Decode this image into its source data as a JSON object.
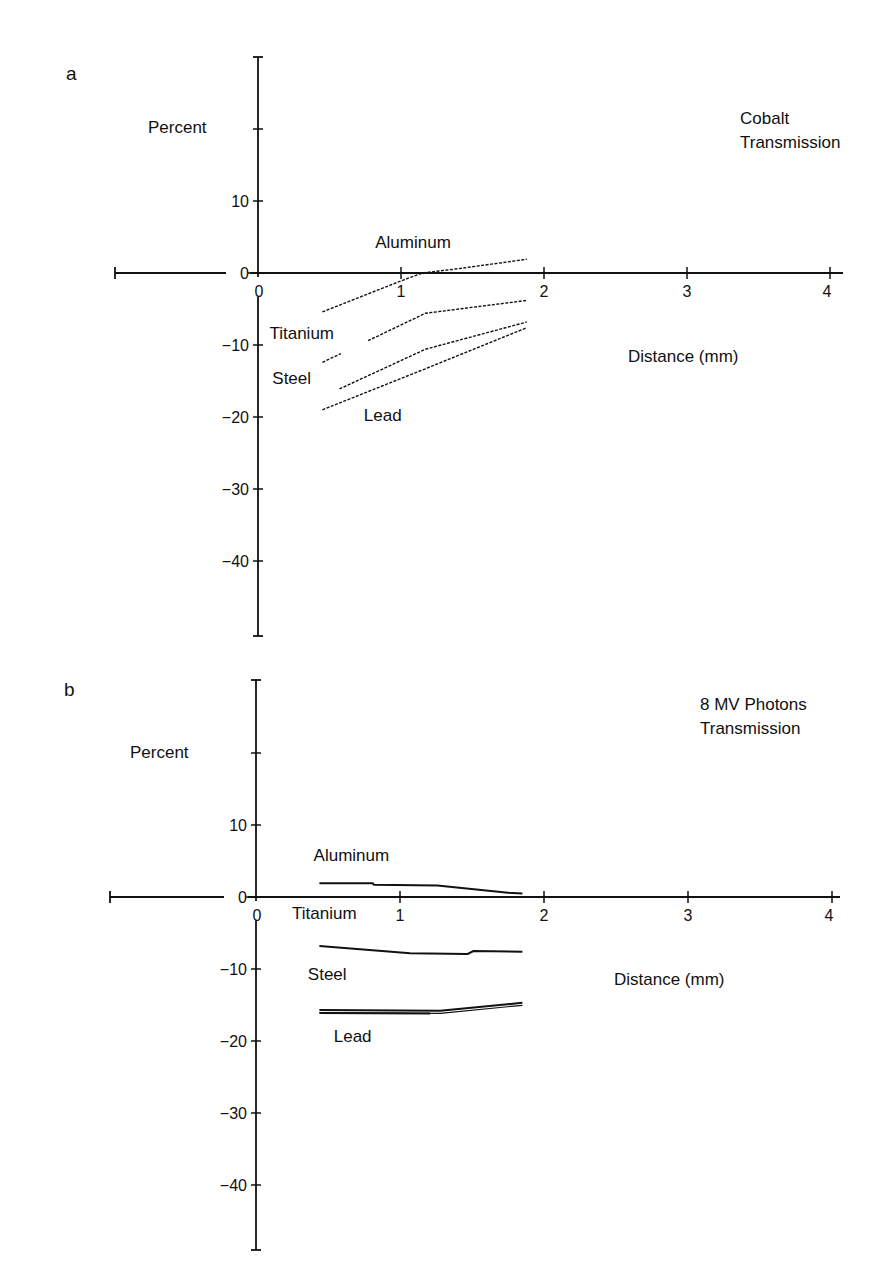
{
  "figure": {
    "background": "#ffffff",
    "ink": "#111111"
  },
  "chart_data": [
    {
      "panel": "a",
      "type": "line",
      "title_lines": [
        "Cobalt",
        "Transmission"
      ],
      "xlabel": "Distance (mm)",
      "ylabel": "Percent",
      "xlim": [
        -1,
        4
      ],
      "ylim": [
        -50,
        30
      ],
      "x_ticks": [
        0,
        1,
        2,
        3,
        4
      ],
      "x_tick_labels": [
        "0",
        "1",
        "2",
        "3",
        "4"
      ],
      "y_ticks": [
        20,
        10,
        0,
        -10,
        -20,
        -30,
        -40
      ],
      "y_tick_labels": [
        "",
        "10",
        "0",
        "-10",
        "-20",
        "-30",
        "-40"
      ],
      "grid": false,
      "legend": "inline labels",
      "series": [
        {
          "name": "Aluminum",
          "style": "dashed",
          "x": [
            0.45,
            1.0,
            1.15,
            1.4,
            1.88
          ],
          "y": [
            -5.4,
            -1.1,
            0.0,
            0.6,
            1.9
          ],
          "label_pos": [
            0.82,
            3.5
          ]
        },
        {
          "name": "Titanium",
          "style": "dashed",
          "segments": [
            {
              "x": [
                0.45,
                0.58
              ],
              "y": [
                -12.4,
                -11.2
              ]
            },
            {
              "x": [
                0.77,
                1.17,
                1.88
              ],
              "y": [
                -9.4,
                -5.6,
                -3.8
              ]
            }
          ],
          "label_pos": [
            0.08,
            -9.2
          ]
        },
        {
          "name": "Steel",
          "style": "dashed",
          "x": [
            0.57,
            1.17,
            1.88
          ],
          "y": [
            -16.1,
            -10.6,
            -6.8
          ],
          "label_pos": [
            0.1,
            -15.4
          ]
        },
        {
          "name": "Lead",
          "style": "dashed",
          "x": [
            0.45,
            1.17,
            1.88
          ],
          "y": [
            -19.0,
            -13.3,
            -7.6
          ],
          "label_pos": [
            0.74,
            -20.5
          ]
        }
      ]
    },
    {
      "panel": "b",
      "type": "line",
      "title_lines": [
        "8 MV Photons",
        "Transmission"
      ],
      "xlabel": "Distance (mm)",
      "ylabel": "Percent",
      "xlim": [
        -1,
        4
      ],
      "ylim": [
        -50,
        30
      ],
      "x_ticks": [
        0,
        1,
        2,
        3,
        4
      ],
      "x_tick_labels": [
        "0",
        "1",
        "2",
        "3",
        "4"
      ],
      "y_ticks": [
        20,
        10,
        0,
        -10,
        -20,
        -30,
        -40
      ],
      "y_tick_labels": [
        "",
        "10",
        "0",
        "-10",
        "-20",
        "-30",
        "-40"
      ],
      "grid": false,
      "legend": "inline labels",
      "series": [
        {
          "name": "Aluminum",
          "style": "solid",
          "x": [
            0.44,
            0.81,
            0.82,
            1.26,
            1.75,
            1.85
          ],
          "y": [
            1.9,
            1.9,
            1.7,
            1.6,
            0.6,
            0.5
          ],
          "label_pos": [
            0.4,
            5.0
          ]
        },
        {
          "name": "Titanium",
          "style": "solid",
          "x": [
            0.44,
            0.81,
            1.07,
            1.47,
            1.51,
            1.85
          ],
          "y": [
            -6.8,
            -7.4,
            -7.8,
            -7.9,
            -7.5,
            -7.6
          ],
          "label_pos": [
            0.25,
            -3.0
          ]
        },
        {
          "name": "Steel",
          "style": "solid",
          "x": [
            0.44,
            1.28,
            1.85
          ],
          "y": [
            -15.7,
            -15.8,
            -14.7
          ],
          "label_pos": [
            0.36,
            -11.5
          ]
        },
        {
          "name": "Lead",
          "style": "solid",
          "x": [
            0.44,
            1.21
          ],
          "y": [
            -16.1,
            -16.2
          ],
          "label_pos": [
            0.54,
            -20.2
          ]
        }
      ]
    }
  ],
  "layout": {
    "panels": [
      {
        "label_x": 66,
        "label_y": 80,
        "x0": 258,
        "xscale": 143,
        "y0": 273,
        "yscale": 7.2,
        "axis_top": 57,
        "axis_bottom": 636,
        "xaxis_left": 115,
        "xaxis_right": 843,
        "title_x": 740,
        "title_y": 124,
        "xlabel_x": 628,
        "xlabel_y": 362,
        "ylabel_x": 148,
        "ylabel_y": 133
      },
      {
        "label_x": 64,
        "label_y": 696,
        "x0": 256,
        "xscale": 144,
        "y0": 897,
        "yscale": 7.2,
        "axis_top": 680,
        "axis_bottom": 1250,
        "xaxis_left": 110,
        "xaxis_right": 840,
        "title_x": 700,
        "title_y": 710,
        "xlabel_x": 614,
        "xlabel_y": 985,
        "ylabel_x": 130,
        "ylabel_y": 758
      }
    ]
  }
}
